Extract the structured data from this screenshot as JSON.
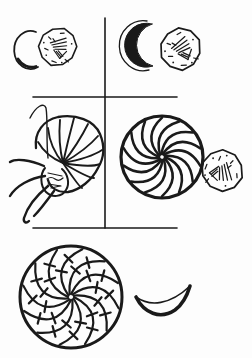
{
  "figure": {
    "type": "hand-drawn-comparative-plate",
    "background_color": "#fdfdfd",
    "ink_color": "#1a1a1a",
    "panels": [
      {
        "name": "top-left",
        "motifs": [
          "open-crescent",
          "struck-coin-with-figure"
        ]
      },
      {
        "name": "top-right",
        "motifs": [
          "crescent-moon",
          "struck-coin-with-figure"
        ]
      },
      {
        "name": "middle-left",
        "motifs": [
          "nautilus-octopus-whorl"
        ]
      },
      {
        "name": "middle-right",
        "motifs": [
          "whirl-rosette",
          "struck-coin-with-figure"
        ]
      },
      {
        "name": "bottom",
        "motifs": [
          "segmented-whirl-rosette",
          "recumbent-crescent"
        ]
      }
    ]
  }
}
